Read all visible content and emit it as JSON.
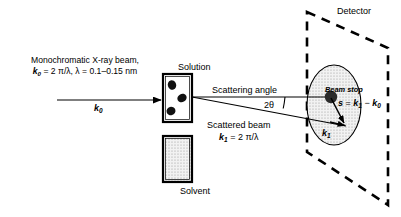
{
  "figure": {
    "type": "saxs-scattering-schematic",
    "title_visible": false,
    "background_color": "#ffffff",
    "line_color": "#000000",
    "fill_gray": "#d9d9d9"
  },
  "incident_beam": {
    "caption_line1": "Monochromatic X-ray beam,",
    "caption_line2_k": "k",
    "caption_line2_sub": "0",
    "caption_line2_rest": " = 2 π/λ, λ = 0.1–0.15 nm",
    "arrow_label_k": "k",
    "arrow_label_sub": "0",
    "arrow": {
      "x1": 57,
      "y1": 100,
      "x2": 163,
      "y2": 100
    }
  },
  "samples": {
    "solution": {
      "label": "Solution",
      "cell": {
        "x": 163,
        "y": 74,
        "w": 29,
        "h": 48
      },
      "particles": [
        {
          "cx": 172,
          "cy": 85,
          "rx": 4.2,
          "ry": 4.8
        },
        {
          "cx": 182,
          "cy": 98,
          "rx": 4.6,
          "ry": 5.0
        },
        {
          "cx": 171,
          "cy": 111,
          "rx": 4.4,
          "ry": 4.8
        }
      ]
    },
    "solvent": {
      "label": "Solvent",
      "cell": {
        "x": 163,
        "y": 136,
        "w": 29,
        "h": 46
      }
    }
  },
  "scattering": {
    "angle_label": "Scattering angle",
    "two_theta_label": "2θ",
    "scattered_beam_label": "Scattered beam",
    "k1_equation_k": "k",
    "k1_equation_sub": "1",
    "k1_equation_rest": " = 2 π/λ",
    "k1_vector_label_k": "k",
    "k1_vector_label_sub": "1"
  },
  "detector": {
    "label": "Detector",
    "outline_points": "307,12 388,48 388,205 307,152",
    "dash_pattern": "9 7",
    "beam_stop_label": "Beam stop",
    "beam_stop": {
      "cx": 331,
      "cy": 97,
      "r": 6.2
    },
    "pattern_ellipse": {
      "cx": 334,
      "cy": 105,
      "rx": 27,
      "ry": 40
    },
    "s_equation": {
      "s": "s",
      "eq": " = ",
      "k1": "k",
      "k1_sub": "1",
      "minus": " − ",
      "k0": "k",
      "k0_sub": "0"
    },
    "s_vector": {
      "x1": 331,
      "y1": 97,
      "x2": 345,
      "y2": 125
    }
  }
}
